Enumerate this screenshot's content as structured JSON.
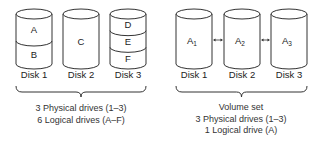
{
  "left_group": {
    "disks": [
      {
        "label": "Disk 1",
        "partitions": [
          "A",
          "B"
        ]
      },
      {
        "label": "Disk 2",
        "partitions": [
          "C"
        ]
      },
      {
        "label": "Disk 3",
        "partitions": [
          "D",
          "E",
          "F"
        ]
      }
    ],
    "caption": [
      "3 Physical drives (1–3)",
      "6 Logical drives (A–F)"
    ]
  },
  "right_group": {
    "disks": [
      {
        "label": "Disk 1",
        "volume": "A",
        "sub": "1"
      },
      {
        "label": "Disk 2",
        "volume": "A",
        "sub": "2"
      },
      {
        "label": "Disk 3",
        "volume": "A",
        "sub": "3"
      }
    ],
    "caption": [
      "Volume set",
      "3 Physical drives (1–3)",
      "1 Logical drive (A)"
    ]
  }
}
